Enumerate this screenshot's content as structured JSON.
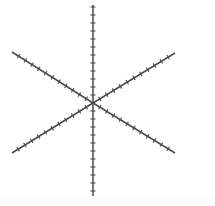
{
  "figure": {
    "caption": "",
    "background_color": "#ffffff",
    "canvas": {
      "width": 215,
      "height": 206
    }
  },
  "chart_data": {
    "type": "scatter",
    "subtitle": "",
    "xlabel": "",
    "ylabel": "",
    "grid": false,
    "legend": null,
    "axis_labels_visible": false,
    "tick_labels_visible": false,
    "xlim": [
      0,
      215
    ],
    "ylim": [
      0,
      206
    ],
    "center": {
      "x": 93,
      "y": 103
    },
    "line_color": "#4a4a4a",
    "line_width": 1.5,
    "tick_color": "#4a4a4a",
    "tick_width": 1.1,
    "tick_length": 5,
    "tick_spacing": 8,
    "ray_count": 6,
    "rays": [
      {
        "name": "ray-up",
        "angle_deg": 90,
        "x1": 93,
        "y1": 103,
        "x2": 93,
        "y2": 5,
        "ticks": 12
      },
      {
        "name": "ray-down",
        "angle_deg": 270,
        "x1": 93,
        "y1": 103,
        "x2": 93,
        "y2": 196,
        "ticks": 11
      },
      {
        "name": "ray-upper-left",
        "angle_deg": 148,
        "x1": 93,
        "y1": 103,
        "x2": 12,
        "y2": 52,
        "ticks": 11
      },
      {
        "name": "ray-lower-right",
        "angle_deg": -32,
        "x1": 93,
        "y1": 103,
        "x2": 175,
        "y2": 153,
        "ticks": 11
      },
      {
        "name": "ray-lower-left",
        "angle_deg": 212,
        "x1": 93,
        "y1": 103,
        "x2": 12,
        "y2": 153,
        "ticks": 11
      },
      {
        "name": "ray-upper-right",
        "angle_deg": 32,
        "x1": 93,
        "y1": 103,
        "x2": 175,
        "y2": 53,
        "ticks": 11
      }
    ]
  }
}
